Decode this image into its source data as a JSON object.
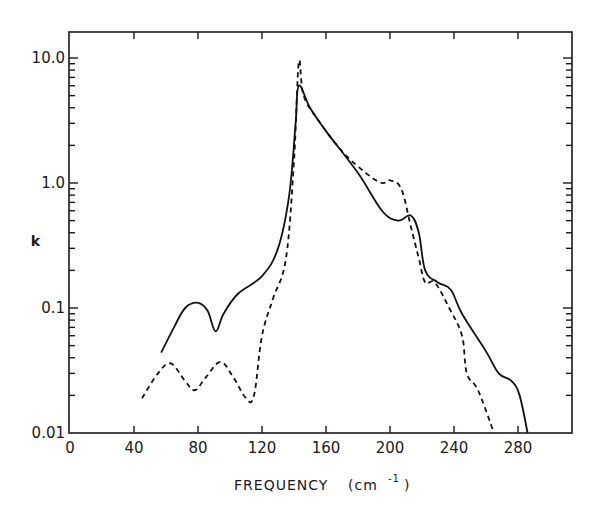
{
  "chart_data": {
    "type": "line",
    "title": "",
    "xlabel": "FREQUENCY (cm⁻¹)",
    "xlabel_main": "FREQUENCY",
    "xlabel_unit": "(cm",
    "xlabel_exp": "-1",
    "xlabel_close": ")",
    "ylabel": "k",
    "xlim": [
      0,
      315
    ],
    "ylim": [
      0.01,
      15.5
    ],
    "yscale": "log",
    "grid": false,
    "legend": null,
    "x_ticks": [
      0,
      40,
      80,
      120,
      160,
      200,
      240,
      280
    ],
    "x_tick_labels": [
      "0",
      "40",
      "80",
      "120",
      "160",
      "200",
      "240",
      "280"
    ],
    "y_ticks": [
      0.01,
      0.1,
      1.0,
      10.0
    ],
    "y_tick_labels": [
      "0.01",
      "0.1",
      "1.0",
      "10.0"
    ],
    "series": [
      {
        "name": "solid",
        "style": "solid",
        "x": [
          57,
          65,
          72,
          80,
          86,
          91,
          96,
          105,
          120,
          130,
          137,
          141,
          143,
          150,
          160,
          180,
          195,
          205,
          213,
          218,
          222,
          230,
          238,
          245,
          260,
          268,
          276,
          281,
          286
        ],
        "values": [
          0.044,
          0.07,
          0.1,
          0.11,
          0.095,
          0.065,
          0.09,
          0.13,
          0.18,
          0.3,
          0.8,
          3.0,
          6.0,
          4.0,
          2.6,
          1.2,
          0.6,
          0.5,
          0.55,
          0.4,
          0.2,
          0.16,
          0.14,
          0.09,
          0.045,
          0.03,
          0.026,
          0.02,
          0.01
        ]
      },
      {
        "name": "dashed",
        "style": "dashed",
        "x": [
          45,
          55,
          63,
          72,
          78,
          85,
          94,
          102,
          110,
          115,
          120,
          127,
          135,
          140,
          143,
          146,
          155,
          170,
          185,
          195,
          200,
          207,
          213,
          218,
          222,
          228,
          237,
          245,
          248,
          255,
          265
        ],
        "values": [
          0.019,
          0.03,
          0.036,
          0.026,
          0.022,
          0.028,
          0.037,
          0.028,
          0.019,
          0.02,
          0.06,
          0.12,
          0.25,
          1.5,
          9.2,
          5.0,
          3.2,
          1.8,
          1.2,
          1.0,
          1.05,
          0.9,
          0.45,
          0.25,
          0.16,
          0.16,
          0.1,
          0.06,
          0.03,
          0.022,
          0.01
        ]
      }
    ]
  }
}
